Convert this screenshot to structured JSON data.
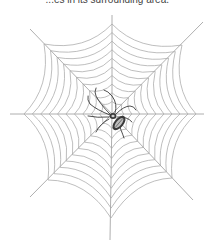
{
  "caption": {
    "text": "...es in its surrounding area."
  },
  "illustration": {
    "subject": "spider-web",
    "web": {
      "center": [
        112,
        114
      ],
      "ring_count": 10,
      "thread_color": "#a8a8a8",
      "radial_color": "#9a9a9a",
      "radials": [
        {
          "direction": "up",
          "end": [
            112,
            15
          ],
          "outer": [
            112,
            24
          ]
        },
        {
          "direction": "up-right",
          "end": [
            203,
            22
          ],
          "outer": [
            182,
            45
          ]
        },
        {
          "direction": "right",
          "end": [
            204,
            114
          ],
          "outer": [
            196,
            114
          ]
        },
        {
          "direction": "down-right",
          "end": [
            193,
            200
          ],
          "outer": [
            172,
            178
          ]
        },
        {
          "direction": "down",
          "end": [
            110,
            240
          ],
          "outer": [
            111,
            218
          ]
        },
        {
          "direction": "down-left",
          "end": [
            30,
            197
          ],
          "outer": [
            48,
            180
          ]
        },
        {
          "direction": "left",
          "end": [
            10,
            114
          ],
          "outer": [
            24,
            114
          ]
        },
        {
          "direction": "up-left",
          "end": [
            30,
            29
          ],
          "outer": [
            44,
            44
          ]
        }
      ]
    },
    "spider": {
      "position": [
        113,
        117
      ],
      "body_color": "#3a3a3a",
      "highlight_color": "#bdbdbd"
    }
  }
}
